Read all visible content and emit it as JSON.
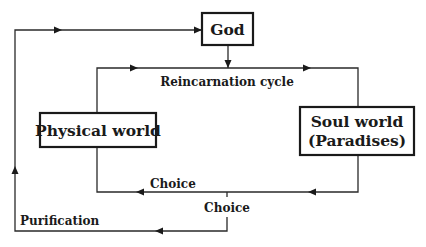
{
  "diagram": {
    "type": "flow-cycle",
    "nodes": {
      "god": {
        "label": "God"
      },
      "physical": {
        "label": "Physical world"
      },
      "soul": {
        "line1": "Soul world",
        "line2": "(Paradises)"
      }
    },
    "edges": {
      "reincarnation": {
        "label": "Reincarnation cycle"
      },
      "choice_inner": {
        "label": "Choice"
      },
      "choice_branch": {
        "label": "Choice"
      },
      "purification": {
        "label": "Purification"
      }
    },
    "colors": {
      "line": "#2a2a2a",
      "box_border": "#1a1a1a",
      "background": "#ffffff",
      "text": "#1a1a1a"
    }
  }
}
